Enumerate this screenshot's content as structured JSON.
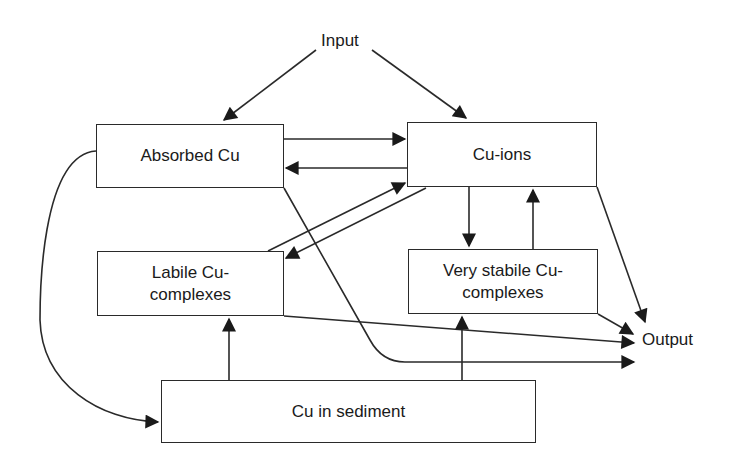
{
  "diagram": {
    "type": "flow",
    "nodes": {
      "input": {
        "label": "Input"
      },
      "absorbed": {
        "label": "Absorbed Cu"
      },
      "ions": {
        "label": "Cu-ions"
      },
      "labile": {
        "label_line1": "Labile Cu-",
        "label_line2": "complexes"
      },
      "stabile": {
        "label_line1": "Very stabile Cu-",
        "label_line2": "complexes"
      },
      "sediment": {
        "label": "Cu in sediment"
      },
      "output": {
        "label": "Output"
      }
    },
    "edges": [
      {
        "from": "Input",
        "to": "Absorbed Cu"
      },
      {
        "from": "Input",
        "to": "Cu-ions"
      },
      {
        "from": "Absorbed Cu",
        "to": "Cu-ions"
      },
      {
        "from": "Cu-ions",
        "to": "Absorbed Cu"
      },
      {
        "from": "Labile Cu-complexes",
        "to": "Cu-ions"
      },
      {
        "from": "Cu-ions",
        "to": "Labile Cu-complexes"
      },
      {
        "from": "Cu-ions",
        "to": "Very stabile Cu-complexes"
      },
      {
        "from": "Very stabile Cu-complexes",
        "to": "Cu-ions"
      },
      {
        "from": "Cu-ions",
        "to": "Output"
      },
      {
        "from": "Very stabile Cu-complexes",
        "to": "Output"
      },
      {
        "from": "Labile Cu-complexes",
        "to": "Output"
      },
      {
        "from": "Absorbed Cu",
        "to": "Output"
      },
      {
        "from": "Absorbed Cu",
        "to": "Cu in sediment"
      },
      {
        "from": "Cu in sediment",
        "to": "Labile Cu-complexes"
      },
      {
        "from": "Cu in sediment",
        "to": "Very stabile Cu-complexes"
      }
    ],
    "colors": {
      "stroke": "#2a2a2a",
      "background": "#ffffff"
    }
  }
}
